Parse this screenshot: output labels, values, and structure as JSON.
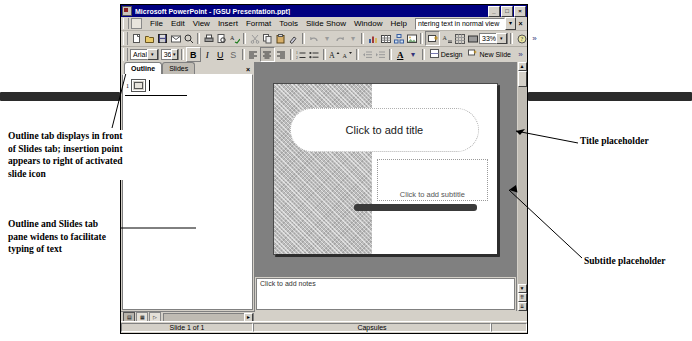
{
  "window": {
    "title": "Microsoft PowerPoint - [GSU Presentation.ppt]",
    "minimize": "_",
    "maximize": "□",
    "close": "×",
    "doc_close": "×"
  },
  "menu": {
    "items": [
      "File",
      "Edit",
      "View",
      "Insert",
      "Format",
      "Tools",
      "Slide Show",
      "Window",
      "Help"
    ],
    "ask_a_question_value": "ntering text in normal view",
    "ask_drop": "▾",
    "ask_close": "×"
  },
  "standard_toolbar": {
    "zoom_value": "33%",
    "drop_arrow": "▾",
    "more_buttons": "»",
    "icons": [
      "new-icon",
      "open-icon",
      "save-icon",
      "mail-icon",
      "search-icon",
      "print-icon",
      "print-preview-icon",
      "spelling-icon",
      "cut-icon",
      "copy-icon",
      "paste-icon",
      "format-painter-icon",
      "undo-icon",
      "redo-icon",
      "insert-chart-icon",
      "insert-table-icon",
      "insert-diagram-icon",
      "insert-clipart-icon",
      "new-slide-icon",
      "expand-all-icon",
      "show-formatting-icon",
      "show-hide-grid-icon"
    ]
  },
  "formatting_toolbar": {
    "font_name": "Arial",
    "font_size": "36",
    "bold": "B",
    "italic": "I",
    "underline": "U",
    "shadow": "S",
    "align_left": "≡",
    "align_center": "≡",
    "align_right": "≡",
    "numbering": "≡",
    "bullets": "≡",
    "increase_font": "A",
    "decrease_font": "A",
    "decrease_indent": "←",
    "increase_indent": "→",
    "font_color": "A",
    "design_label": "Design",
    "new_slide_label": "New Slide",
    "more_buttons": "»"
  },
  "tab_pane": {
    "tabs": [
      {
        "label": "Outline",
        "active": true
      },
      {
        "label": "Slides",
        "active": false
      }
    ],
    "close": "×",
    "slide_number": "1"
  },
  "slide": {
    "title_placeholder": "Click to add title",
    "subtitle_placeholder": "Click to add subtitle"
  },
  "notes": {
    "placeholder": "Click to add notes"
  },
  "scroll": {
    "up": "▲",
    "down": "▼",
    "prev_slide": "⇈",
    "next_slide": "⇊",
    "left": "◄",
    "right": "►"
  },
  "view_bar": {
    "normal_view": "▤",
    "slide_sorter_view": "▦",
    "slide_show_view": "▷"
  },
  "status_bar": {
    "slide_count": "Slide 1 of 1",
    "design_name": "Capsules",
    "end_cell": ""
  },
  "annotations": {
    "outline_tab": "Outline tab displays in front of Slides tab; insertion point appears to right of activated slide icon",
    "pane_widens": "Outline and Slides tab pane widens to facilitate typing of text",
    "title_placeholder": "Title placeholder",
    "subtitle_placeholder": "Subtitle placeholder"
  },
  "colors": {
    "titlebar": "#000080",
    "chrome": "#d4d0c8",
    "workspace": "#808080",
    "slide_band": "#bdbdbd",
    "dark_bar": "#3a3a3a"
  }
}
